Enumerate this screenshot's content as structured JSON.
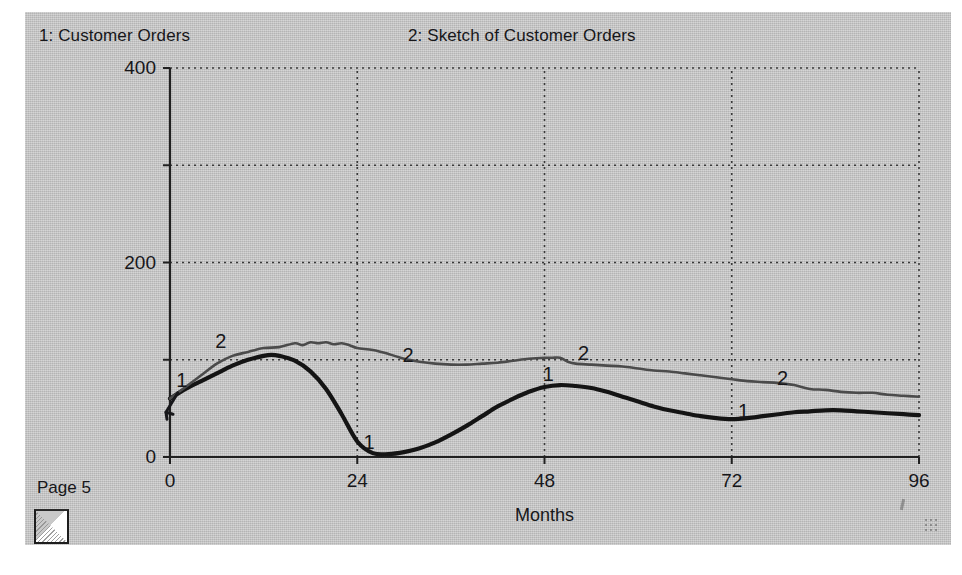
{
  "page": {
    "footer_label": "Page 5",
    "background_color": "#c6c6c6",
    "grow_box_icon": "resize-grow-box-icon",
    "grip_icon": "grip-dots-icon"
  },
  "header": {
    "series1_title": "1: Customer Orders",
    "series2_title": "2: Sketch of Customer Orders"
  },
  "chart_data": {
    "type": "line",
    "title": "",
    "xlabel": "Months",
    "ylabel": "",
    "xlim": [
      0,
      96
    ],
    "ylim": [
      0,
      400
    ],
    "xticks": [
      "0",
      "24",
      "48",
      "72",
      "96"
    ],
    "xtick_values": [
      0,
      24,
      48,
      72,
      96
    ],
    "yticks": [
      "0",
      "200",
      "400"
    ],
    "ytick_values": [
      0,
      200,
      400
    ],
    "ygrid_values": [
      0,
      100,
      200,
      300,
      400
    ],
    "grid": true,
    "legend_position": "inline-curve-labels",
    "inline_labels": [
      {
        "series": "1",
        "x": 1.5,
        "y": 72
      },
      {
        "series": "2",
        "x": 6.5,
        "y": 112
      },
      {
        "series": "1",
        "x": 25.5,
        "y": 8
      },
      {
        "series": "2",
        "x": 30.5,
        "y": 98
      },
      {
        "series": "1",
        "x": 48.5,
        "y": 78
      },
      {
        "series": "2",
        "x": 53.0,
        "y": 100
      },
      {
        "series": "1",
        "x": 73.5,
        "y": 40
      },
      {
        "series": "2",
        "x": 78.5,
        "y": 74
      }
    ],
    "series": [
      {
        "name": "1",
        "label": "Customer Orders",
        "color": "#141414",
        "width": 4.2,
        "x": [
          0,
          2,
          4,
          6,
          8,
          10,
          12,
          13,
          14,
          16,
          18,
          20,
          22,
          24,
          26,
          28,
          30,
          32,
          34,
          36,
          38,
          40,
          42,
          44,
          46,
          48,
          50,
          52,
          54,
          56,
          58,
          60,
          62,
          64,
          66,
          68,
          70,
          72,
          74,
          76,
          78,
          80,
          82,
          84,
          86,
          88,
          90,
          92,
          94,
          96
        ],
        "y": [
          60,
          70,
          78,
          86,
          94,
          100,
          104,
          105,
          104,
          99,
          88,
          70,
          44,
          16,
          4,
          3,
          5,
          9,
          15,
          23,
          32,
          42,
          52,
          60,
          67,
          72,
          74,
          73,
          71,
          67,
          62,
          57,
          52,
          48,
          45,
          42,
          40,
          39,
          40,
          42,
          44,
          46,
          47,
          48,
          48,
          47,
          46,
          45,
          44,
          43
        ]
      },
      {
        "name": "2",
        "label": "Sketch of Customer Orders",
        "color": "#4b4b4b",
        "width": 2.6,
        "x": [
          0,
          2,
          4,
          6,
          8,
          10,
          12,
          14,
          16,
          17,
          18,
          19,
          20,
          21,
          22,
          23,
          24,
          26,
          28,
          30,
          32,
          34,
          36,
          38,
          40,
          42,
          44,
          46,
          48,
          49,
          50,
          51,
          52,
          54,
          56,
          58,
          60,
          62,
          64,
          66,
          68,
          70,
          72,
          74,
          76,
          78,
          80,
          82,
          84,
          86,
          88,
          90,
          92,
          94,
          96
        ],
        "y": [
          60,
          72,
          84,
          96,
          104,
          108,
          112,
          113,
          117,
          115,
          118,
          117,
          118,
          116,
          117,
          115,
          112,
          110,
          106,
          101,
          98,
          96,
          95,
          95,
          96,
          97,
          99,
          101,
          102,
          102,
          102,
          98,
          96,
          95,
          94,
          93,
          91,
          89,
          88,
          86,
          84,
          82,
          80,
          78,
          77,
          76,
          74,
          70,
          69,
          67,
          66,
          66,
          64,
          63,
          62
        ]
      }
    ]
  }
}
